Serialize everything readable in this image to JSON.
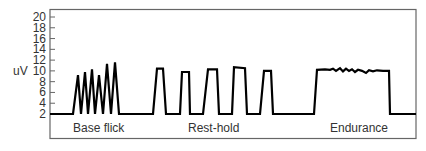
{
  "chart_data": {
    "type": "line",
    "title": "",
    "xlabel": "",
    "ylabel": "uV",
    "ylim": [
      2,
      20
    ],
    "yticks": [
      2,
      4,
      6,
      8,
      10,
      12,
      14,
      16,
      18,
      20
    ],
    "grid": false,
    "legend": null,
    "segments": [
      {
        "label": "Base flick",
        "description": "rapid flicks",
        "peaks": [
          9.2,
          9.8,
          10.3,
          9.2,
          11.3,
          11.6
        ]
      },
      {
        "label": "Rest-hold",
        "description": "five sustained holds",
        "peaks": [
          10.4,
          9.8,
          10.3,
          10.7,
          10.0
        ]
      },
      {
        "label": "Endurance",
        "description": "single long sustained hold",
        "level": 10.0
      }
    ],
    "series": [
      {
        "name": "EMG",
        "points": [
          [
            50,
            2
          ],
          [
            73,
            2
          ],
          [
            78,
            9.2
          ],
          [
            81,
            2
          ],
          [
            85,
            9.8
          ],
          [
            88,
            2
          ],
          [
            92,
            10.3
          ],
          [
            95,
            2
          ],
          [
            99,
            9.2
          ],
          [
            103,
            2
          ],
          [
            107,
            11.3
          ],
          [
            111,
            2
          ],
          [
            115,
            11.6
          ],
          [
            119,
            2
          ],
          [
            153,
            2
          ],
          [
            157,
            10.4
          ],
          [
            163,
            10.4
          ],
          [
            166,
            2
          ],
          [
            180,
            2
          ],
          [
            182,
            9.8
          ],
          [
            189,
            9.8
          ],
          [
            190,
            2
          ],
          [
            203,
            2
          ],
          [
            208,
            10.3
          ],
          [
            217,
            10.3
          ],
          [
            219,
            2
          ],
          [
            232,
            2
          ],
          [
            234,
            10.7
          ],
          [
            245,
            10.5
          ],
          [
            247,
            2
          ],
          [
            260,
            2
          ],
          [
            264,
            10.0
          ],
          [
            271,
            10.0
          ],
          [
            273,
            2
          ],
          [
            314,
            2
          ],
          [
            317,
            10.2
          ],
          [
            325,
            10.3
          ],
          [
            330,
            10.2
          ],
          [
            333,
            10.4
          ],
          [
            336,
            10.0
          ],
          [
            340,
            10.5
          ],
          [
            343,
            9.9
          ],
          [
            346,
            10.4
          ],
          [
            349,
            10.0
          ],
          [
            352,
            10.3
          ],
          [
            355,
            9.8
          ],
          [
            358,
            10.2
          ],
          [
            362,
            10.0
          ],
          [
            366,
            9.6
          ],
          [
            369,
            10.1
          ],
          [
            373,
            9.9
          ],
          [
            377,
            10.1
          ],
          [
            383,
            10.0
          ],
          [
            389,
            10.0
          ],
          [
            390,
            2
          ],
          [
            416,
            2
          ]
        ]
      }
    ]
  }
}
